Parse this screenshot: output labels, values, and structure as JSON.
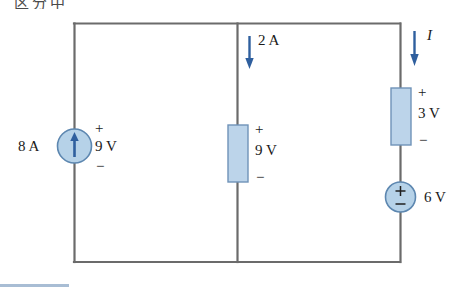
{
  "page": {
    "header_fragment": "区分中",
    "background_color": "#ffffff"
  },
  "colors": {
    "wire": "#6b6b6b",
    "element_fill": "#bcd4ea",
    "element_stroke": "#6f93b8",
    "arrow": "#2f5f9e",
    "source_fill": "#b6d2e8",
    "source_stroke": "#5d87b0",
    "text": "#1a1a1a",
    "footer_rule": "#a8bdd4"
  },
  "circuit": {
    "type": "dc-circuit-schematic",
    "topology": "single loop with three parallel vertical branches sharing a top rail and bottom rail",
    "branches": [
      {
        "id": "left-branch",
        "position": "left",
        "element": {
          "kind": "current-source",
          "symbol": "circle-with-up-arrow",
          "arrow_direction": "up",
          "current_label": "8 A",
          "voltage_label": "9 V",
          "polarity_top": "+",
          "polarity_bottom": "−",
          "polarity_side": "right"
        }
      },
      {
        "id": "middle-branch",
        "position": "middle",
        "branch_current": {
          "label": "2 A",
          "arrow_direction": "down"
        },
        "element": {
          "kind": "rectangular-element",
          "symbol": "box",
          "voltage_label": "9 V",
          "polarity_top": "+",
          "polarity_bottom": "−",
          "polarity_side": "right"
        }
      },
      {
        "id": "right-branch",
        "position": "right",
        "branch_current": {
          "label": "I",
          "arrow_direction": "down",
          "italic": true
        },
        "elements": [
          {
            "kind": "rectangular-element",
            "symbol": "box",
            "voltage_label": "3 V",
            "polarity_top": "+",
            "polarity_bottom": "−",
            "polarity_side": "right"
          },
          {
            "kind": "voltage-source",
            "symbol": "circle-with-plus-minus",
            "voltage_label": "6 V",
            "polarity_top": "+",
            "polarity_bottom": "−",
            "polarity_inside": true,
            "label_side": "right"
          }
        ]
      }
    ],
    "labels": {
      "left_current": "8 A",
      "left_voltage": "9 V",
      "left_plus": "+",
      "left_minus": "−",
      "mid_current": "2 A",
      "mid_voltage": "9 V",
      "mid_plus": "+",
      "mid_minus": "−",
      "right_current": "I",
      "right_voltage_box": "3 V",
      "right_box_plus": "+",
      "right_box_minus": "−",
      "right_source_voltage": "6 V",
      "right_source_plus": "+",
      "right_source_minus": "−"
    }
  }
}
